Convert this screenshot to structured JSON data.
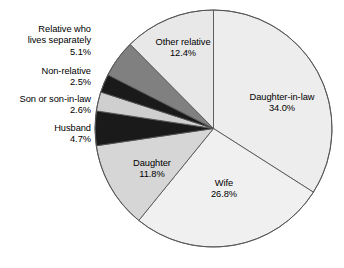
{
  "chart_data": {
    "type": "pie",
    "title": "",
    "subtitle": "",
    "xlabel": "",
    "ylabel": "",
    "legend_position": "none",
    "grid": false,
    "unit": "%",
    "categories": [
      "Daughter-in-law",
      "Wife",
      "Daughter",
      "Husband",
      "Son or son-in-law",
      "Non-relative",
      "Relative who lives separately",
      "Other relative"
    ],
    "values": [
      34.0,
      26.8,
      11.8,
      4.7,
      2.6,
      2.5,
      5.1,
      12.4
    ],
    "start_angle_deg": 0,
    "direction": "clockwise",
    "slices": [
      {
        "label": "Daughter-in-law",
        "label_line1": "Daughter-in-law",
        "value": 34.0,
        "value_text": "34.0%",
        "color": "#ededed",
        "label_placement": "inside"
      },
      {
        "label": "Wife",
        "label_line1": "Wife",
        "value": 26.8,
        "value_text": "26.8%",
        "color": "#f0f0f0",
        "label_placement": "inside"
      },
      {
        "label": "Daughter",
        "label_line1": "Daughter",
        "value": 11.8,
        "value_text": "11.8%",
        "color": "#d6d6d6",
        "label_placement": "inside"
      },
      {
        "label": "Husband",
        "label_line1": "Husband",
        "value": 4.7,
        "value_text": "4.7%",
        "color": "#1a1a1a",
        "label_placement": "outside-left"
      },
      {
        "label": "Son or son-in-law",
        "label_line1": "Son or son-in-law",
        "value": 2.6,
        "value_text": "2.6%",
        "color": "#cfcfcf",
        "label_placement": "outside-left"
      },
      {
        "label": "Non-relative",
        "label_line1": "Non-relative",
        "value": 2.5,
        "value_text": "2.5%",
        "color": "#1a1a1a",
        "label_placement": "outside-left"
      },
      {
        "label": "Relative who lives separately",
        "label_line1": "Relative who",
        "label_line2": "lives separately",
        "value": 5.1,
        "value_text": "5.1%",
        "color": "#808080",
        "label_placement": "outside-left"
      },
      {
        "label": "Other relative",
        "label_line1": "Other relative",
        "value": 12.4,
        "value_text": "12.4%",
        "color": "#e8e8e8",
        "label_placement": "inside"
      }
    ],
    "colors": {
      "outline": "#555555",
      "background": "#ffffff",
      "text": "#000000"
    }
  }
}
